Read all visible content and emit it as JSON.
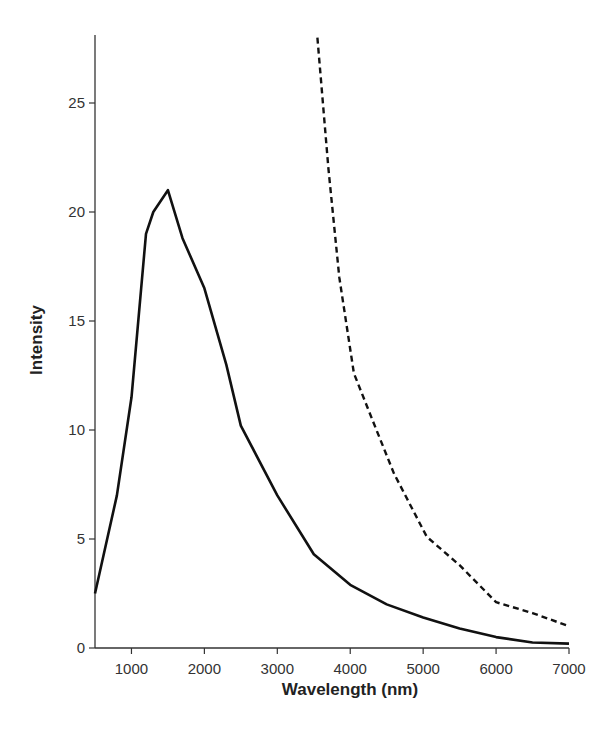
{
  "chart_data": {
    "type": "line",
    "title": "",
    "xlabel": "Wavelength (nm)",
    "ylabel": "Intensity",
    "xlim": [
      500,
      7000
    ],
    "ylim": [
      0,
      28
    ],
    "grid": false,
    "legend": null,
    "x_ticks": [
      1000,
      2000,
      3000,
      4000,
      5000,
      6000,
      7000
    ],
    "y_ticks": [
      0,
      5,
      10,
      15,
      20,
      25
    ],
    "series": [
      {
        "name": "solid",
        "style": "solid",
        "color": "#111111",
        "x": [
          500,
          800,
          1000,
          1200,
          1300,
          1500,
          1700,
          2000,
          2300,
          2500,
          3000,
          3500,
          4000,
          4500,
          5000,
          5500,
          6000,
          6500,
          7000
        ],
        "y": [
          2.5,
          7.0,
          11.5,
          19.0,
          20.0,
          21.0,
          18.8,
          16.5,
          13.0,
          10.2,
          7.0,
          4.3,
          2.9,
          2.0,
          1.4,
          0.9,
          0.5,
          0.25,
          0.2
        ]
      },
      {
        "name": "dashed",
        "style": "dashed",
        "color": "#111111",
        "x": [
          3550,
          3700,
          3850,
          4050,
          4300,
          4600,
          5050,
          5500,
          6000,
          6500,
          7000
        ],
        "y": [
          28.0,
          22.0,
          17.0,
          12.6,
          10.5,
          8.0,
          5.1,
          3.8,
          2.1,
          1.6,
          1.0
        ]
      }
    ]
  }
}
